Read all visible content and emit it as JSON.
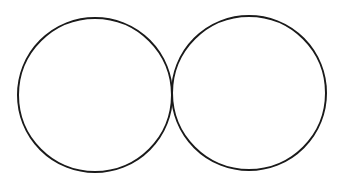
{
  "diagram": {
    "shape_count": 2,
    "shapes": [
      {
        "id": "left-circle",
        "type": "circle",
        "label": ""
      },
      {
        "id": "right-circle",
        "type": "circle",
        "label": ""
      }
    ],
    "relationship": "externally tangent",
    "colors": {
      "background": "#ffffff",
      "stroke": "#1a1a1a"
    }
  }
}
